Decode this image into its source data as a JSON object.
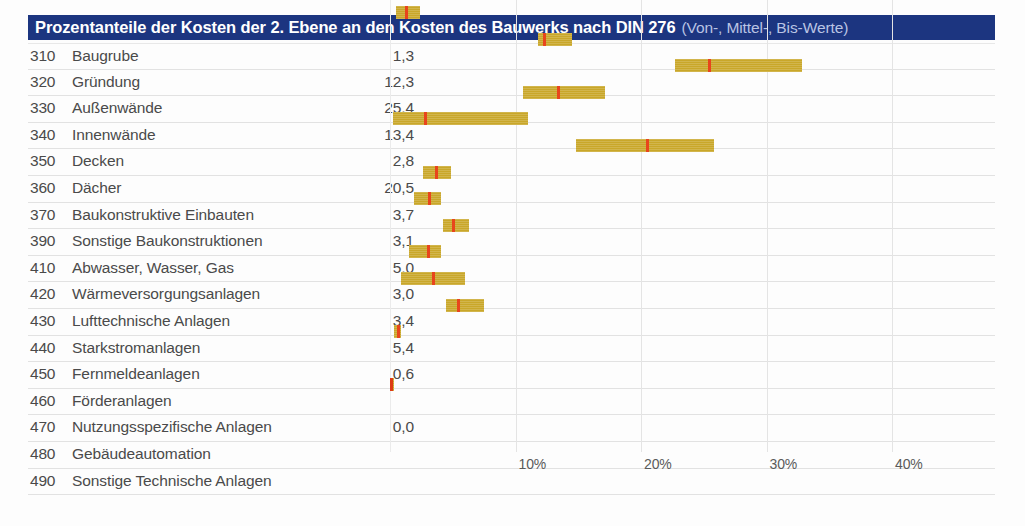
{
  "header": {
    "title_main": "Prozentanteile der Kosten der 2. Ebene an den Kosten des Bauwerks nach DIN 276",
    "title_sub": "(Von-, Mittel-, Bis-Werte)",
    "accent_color": "#1c3580",
    "bar_color": "#c9a72a",
    "marker_color": "#e8451c"
  },
  "chart_data": {
    "type": "bar",
    "title": "Prozentanteile der Kosten der 2. Ebene an den Kosten des Bauwerks nach DIN 276 (Von-, Mittel-, Bis-Werte)",
    "xlabel": "",
    "ylabel": "",
    "xlim": [
      0,
      45.5
    ],
    "grid": true,
    "legend": "none",
    "tick_labels": [
      "10%",
      "20%",
      "30%",
      "40%"
    ],
    "ticks": [
      10,
      20,
      30,
      40
    ],
    "value_format": "Mittelwert in Prozent",
    "columns": [
      "Kostengruppe",
      "Bezeichnung",
      "Mittelwert"
    ],
    "rows": [
      {
        "code": "310",
        "label": "Baugrube",
        "value": "1,3",
        "mid": 1.3,
        "von": 0.5,
        "bis": 2.4
      },
      {
        "code": "320",
        "label": "Gründung",
        "value": "12,3",
        "mid": 12.3,
        "von": 11.8,
        "bis": 14.5
      },
      {
        "code": "330",
        "label": "Außenwände",
        "value": "25,4",
        "mid": 25.4,
        "von": 22.7,
        "bis": 32.8
      },
      {
        "code": "340",
        "label": "Innenwände",
        "value": "13,4",
        "mid": 13.4,
        "von": 10.6,
        "bis": 17.1
      },
      {
        "code": "350",
        "label": "Decken",
        "value": "2,8",
        "mid": 2.8,
        "von": 0.2,
        "bis": 11.0
      },
      {
        "code": "360",
        "label": "Dächer",
        "value": "20,5",
        "mid": 20.5,
        "von": 14.8,
        "bis": 25.8
      },
      {
        "code": "370",
        "label": "Baukonstruktive Einbauten",
        "value": "3,7",
        "mid": 3.7,
        "von": 2.6,
        "bis": 4.9
      },
      {
        "code": "390",
        "label": "Sonstige Baukonstruktionen",
        "value": "3,1",
        "mid": 3.1,
        "von": 1.9,
        "bis": 4.1
      },
      {
        "code": "410",
        "label": "Abwasser, Wasser, Gas",
        "value": "5,0",
        "mid": 5.0,
        "von": 4.2,
        "bis": 6.3
      },
      {
        "code": "420",
        "label": "Wärmeversorgungsanlagen",
        "value": "3,0",
        "mid": 3.0,
        "von": 1.5,
        "bis": 4.1
      },
      {
        "code": "430",
        "label": "Lufttechnische Anlagen",
        "value": "3,4",
        "mid": 3.4,
        "von": 0.9,
        "bis": 6.0
      },
      {
        "code": "440",
        "label": "Starkstromanlagen",
        "value": "5,4",
        "mid": 5.4,
        "von": 4.5,
        "bis": 7.5
      },
      {
        "code": "450",
        "label": "Fernmeldeanlagen",
        "value": "0,6",
        "mid": 0.6,
        "von": 0.3,
        "bis": 0.9
      },
      {
        "code": "460",
        "label": "Förderanlagen",
        "value": "",
        "mid": null,
        "von": null,
        "bis": null
      },
      {
        "code": "470",
        "label": "Nutzungsspezifische Anlagen",
        "value": "0,0",
        "mid": 0.05,
        "von": 0.0,
        "bis": 0.1
      },
      {
        "code": "480",
        "label": "Gebäudeautomation",
        "value": "",
        "mid": null,
        "von": null,
        "bis": null
      },
      {
        "code": "490",
        "label": "Sonstige Technische Anlagen",
        "value": "",
        "mid": null,
        "von": null,
        "bis": null
      }
    ]
  }
}
